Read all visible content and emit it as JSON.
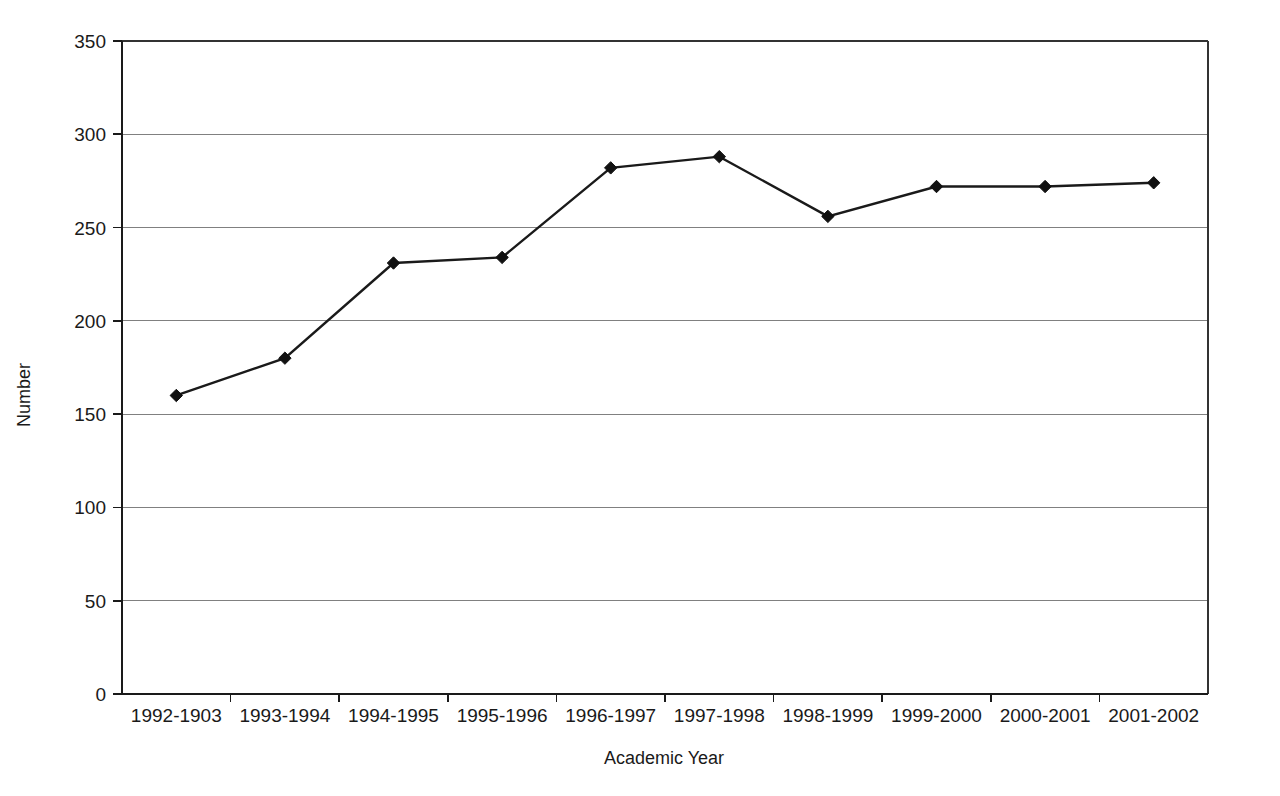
{
  "chart_data": {
    "type": "line",
    "title": "",
    "subtitle": "",
    "xlabel": "Academic Year",
    "ylabel": "Number",
    "categories": [
      "1992-1903",
      "1993-1994",
      "1994-1995",
      "1995-1996",
      "1996-1997",
      "1997-1998",
      "1998-1999",
      "1999-2000",
      "2000-2001",
      "2001-2002"
    ],
    "values": [
      160,
      180,
      231,
      234,
      282,
      288,
      256,
      272,
      272,
      274
    ],
    "series": [
      {
        "name": "Number",
        "values": [
          160,
          180,
          231,
          234,
          282,
          288,
          256,
          272,
          272,
          274
        ]
      }
    ],
    "ylim": [
      0,
      350
    ],
    "yticks": [
      0,
      50,
      100,
      150,
      200,
      250,
      300,
      350
    ],
    "ytick_labels": [
      "0",
      "50",
      "100",
      "150",
      "200",
      "250",
      "300",
      "350"
    ],
    "grid": true,
    "grid_axis": "y",
    "legend": false,
    "legend_position": "none",
    "marker": "diamond",
    "line_color": "#1a1a1a",
    "marker_color": "#111111",
    "grid_color": "#808080",
    "background_color": "#ffffff"
  },
  "axes": {
    "y_axis_title": "Number",
    "x_axis_title": "Academic Year"
  }
}
